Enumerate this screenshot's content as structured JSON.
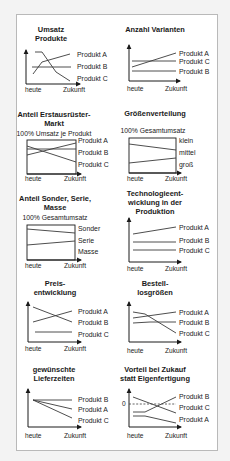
{
  "axis_labels": {
    "x_start": "heute",
    "x_end": "Zukunft"
  },
  "charts": [
    {
      "title_lines": [
        "Umsatz",
        "Produkte"
      ],
      "subtitle": "",
      "legend": [
        "Produkt A",
        "Produkt B",
        "Produkt C"
      ],
      "style": "axes"
    },
    {
      "title_lines": [
        "Anzahl Varianten"
      ],
      "subtitle": "",
      "legend": [
        "Produkt A",
        "Produkt C",
        "Produkt B"
      ],
      "style": "axes"
    },
    {
      "title_lines": [
        "Anteil Erstausrüster-",
        "Markt"
      ],
      "subtitle": "100% Umsatz je Produkt",
      "legend": [
        "Produkt A",
        "Produkt B",
        "Produkt C"
      ],
      "style": "box"
    },
    {
      "title_lines": [
        "Größenverteilung"
      ],
      "subtitle": "100% Gesamtumsatz",
      "legend": [
        "klein",
        "mittel",
        "groß"
      ],
      "style": "box"
    },
    {
      "title_lines": [
        "Anteil Sonder, Serie,",
        "Masse"
      ],
      "subtitle": "100% Gesamtumsatz",
      "legend": [
        "Sonder",
        "Serie",
        "Masse"
      ],
      "style": "box"
    },
    {
      "title_lines": [
        "Technologieent-",
        "wicklung in der",
        "Produktion"
      ],
      "subtitle": "",
      "legend": [
        "Produkt A",
        "Produkt B",
        "Produkt C"
      ],
      "style": "axes"
    },
    {
      "title_lines": [
        "Preis-",
        "entwicklung"
      ],
      "subtitle": "",
      "legend": [
        "Produkt A",
        "Produkt B",
        "Produkt C"
      ],
      "style": "axes"
    },
    {
      "title_lines": [
        "Bestell-",
        "losgrößen"
      ],
      "subtitle": "",
      "legend": [
        "Produkt A",
        "Produkt B",
        "Produkt C"
      ],
      "style": "axes"
    },
    {
      "title_lines": [
        "gewünschte",
        "Lieferzeiten"
      ],
      "subtitle": "",
      "legend": [
        "Produkt B",
        "Produkt A",
        "Produkt C"
      ],
      "style": "axes"
    },
    {
      "title_lines": [
        "Vorteil bei Zukauf",
        "statt Eigenfertigung"
      ],
      "subtitle": "",
      "legend": [
        "Produkt B",
        "Produkt C",
        "Produkt A"
      ],
      "zero_label": "0",
      "style": "axes"
    }
  ],
  "colors": {
    "panel_bg": "#ffffff",
    "page_bg": "#f3f3f3",
    "border": "#b9b9b9",
    "ink": "#1a1a1a"
  }
}
